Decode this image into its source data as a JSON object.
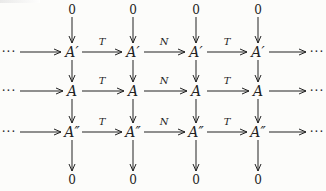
{
  "diagram": {
    "type": "commutative-diagram",
    "columns_x": [
      72,
      133,
      196,
      258
    ],
    "rows": {
      "top_zero": {
        "y": 10,
        "label": "0"
      },
      "row1": {
        "y": 52,
        "label": "A′"
      },
      "row2": {
        "y": 91,
        "label": "A"
      },
      "row3": {
        "y": 132,
        "label": "A″"
      },
      "bottom_zero": {
        "y": 181,
        "label": "0"
      }
    },
    "ellipsis": "···",
    "horizontal_labels": [
      "T",
      "N",
      "T"
    ],
    "nodes": {
      "zero": "0",
      "a_prime": "A′",
      "a": "A",
      "a_double_prime": "A″"
    },
    "label_T": "T",
    "label_N": "N"
  }
}
